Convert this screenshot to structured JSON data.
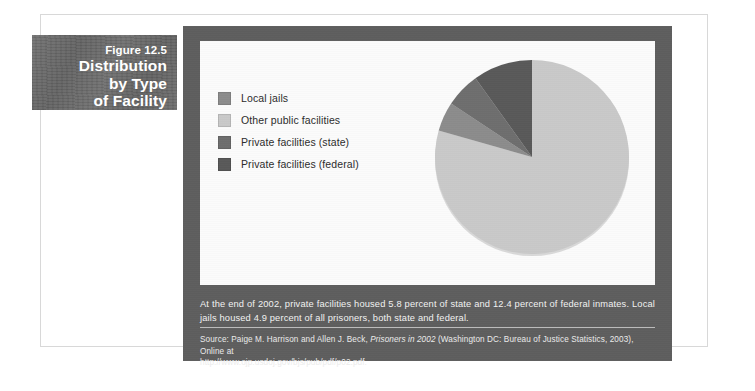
{
  "figure": {
    "number": "Figure 12.5",
    "title_line1": "Distribution",
    "title_line2": "by Type",
    "title_line3": "of Facility"
  },
  "legend": {
    "items": [
      {
        "label": "Local jails",
        "color": "#8c8c8c"
      },
      {
        "label": "Other public facilities",
        "color": "#c9c9c9"
      },
      {
        "label": "Private facilities (state)",
        "color": "#6e6e6e"
      },
      {
        "label": "Private facilities (federal)",
        "color": "#595959"
      }
    ]
  },
  "note": {
    "text": "At the end of 2002, private facilities housed 5.8 percent of state and 12.4 percent of federal inmates. Local jails housed 4.9 percent of all prisoners, both state and federal."
  },
  "source": {
    "prefix": "Source: Paige M. Harrison and Allen J. Beck,",
    "italic_title": "Prisoners in 2002",
    "suffix": "(Washington DC: Bureau of Justice Statistics, 2003), Online at",
    "url": "http://www.ojp.usdoj.gov/bjs/pub/pdf/p02.pdf."
  },
  "chart_data": {
    "type": "pie",
    "title": "Distribution by Type of Facility",
    "categories": [
      "Other public facilities",
      "Local jails",
      "Private facilities (state)",
      "Private facilities (federal)"
    ],
    "values": [
      79.4,
      4.9,
      5.8,
      9.9
    ],
    "unit": "percent",
    "colors": [
      "#c9c9c9",
      "#8c8c8c",
      "#6e6e6e",
      "#595959"
    ],
    "start_angle_deg": 0,
    "direction": "clockwise",
    "legend_position": "left",
    "grid": false,
    "labels_shown": false
  }
}
